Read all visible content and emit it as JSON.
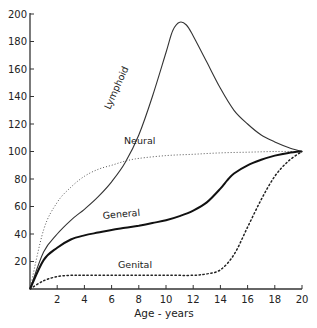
{
  "chart_data": {
    "type": "line",
    "title": "",
    "xlabel": "Age - years",
    "ylabel": "",
    "xlim": [
      0,
      20
    ],
    "ylim": [
      0,
      200
    ],
    "grid": false,
    "legend": "inline labels on curves",
    "x_ticks": [
      2,
      4,
      6,
      8,
      10,
      12,
      14,
      16,
      18,
      20
    ],
    "x_tick_labels": [
      "2",
      "4",
      "6",
      "8",
      "10",
      "12",
      "14",
      "16",
      "18",
      "20"
    ],
    "y_ticks": [
      20,
      40,
      60,
      80,
      100,
      120,
      140,
      160,
      180,
      200
    ],
    "y_tick_labels": [
      "20",
      "40",
      "60",
      "80",
      "100",
      "120",
      "140",
      "160",
      "180",
      "200"
    ],
    "series": [
      {
        "name": "Lymphoid",
        "style": "solid-thin",
        "x": [
          0,
          1,
          2,
          3,
          4,
          5,
          6,
          7,
          8,
          9,
          10,
          10.5,
          11,
          11.5,
          12,
          13,
          14,
          15,
          16,
          17,
          18,
          19,
          20
        ],
        "values": [
          0,
          27,
          40,
          50,
          58,
          67,
          78,
          92,
          112,
          140,
          172,
          188,
          194,
          192,
          184,
          165,
          146,
          130,
          120,
          112,
          107,
          103,
          100
        ]
      },
      {
        "name": "Neural",
        "style": "dotted-fine",
        "x": [
          0,
          1,
          2,
          3,
          4,
          5,
          6,
          7,
          8,
          10,
          12,
          14,
          16,
          18,
          20
        ],
        "values": [
          0,
          43,
          63,
          74,
          82,
          87,
          90,
          93,
          95,
          97,
          98,
          99,
          99.5,
          100,
          100
        ]
      },
      {
        "name": "General",
        "style": "solid-thick",
        "x": [
          0,
          1,
          2,
          3,
          4,
          5,
          6,
          7,
          8,
          9,
          10,
          11,
          12,
          13,
          14,
          14.5,
          15,
          16,
          17,
          18,
          19,
          20
        ],
        "values": [
          0,
          21,
          30,
          36,
          39,
          41,
          43,
          44.5,
          46,
          48,
          50,
          53,
          57,
          63,
          73,
          79,
          84,
          90,
          94,
          97,
          99,
          100
        ]
      },
      {
        "name": "Genital",
        "style": "dotted-coarse",
        "x": [
          0,
          1,
          2,
          3,
          4,
          6,
          8,
          10,
          12,
          13,
          14,
          15,
          16,
          17,
          18,
          19,
          20
        ],
        "values": [
          0,
          6,
          9,
          10,
          10,
          10,
          10,
          10,
          10,
          11,
          14,
          25,
          45,
          65,
          82,
          93,
          100
        ]
      }
    ],
    "annotations": [
      {
        "text": "Lymphoid",
        "x": 5.7,
        "y": 118,
        "rotation": -62
      },
      {
        "text": "Neural",
        "x": 7.1,
        "y": 112
      },
      {
        "text": "General",
        "x": 5.5,
        "y": 56
      },
      {
        "text": "Genital",
        "x": 5.5,
        "y": 17
      }
    ]
  },
  "labels": {
    "xlabel": "Age - years",
    "lymphoid": "Lymphoid",
    "neural": "Neural",
    "general": "General",
    "genital": "Genital"
  }
}
